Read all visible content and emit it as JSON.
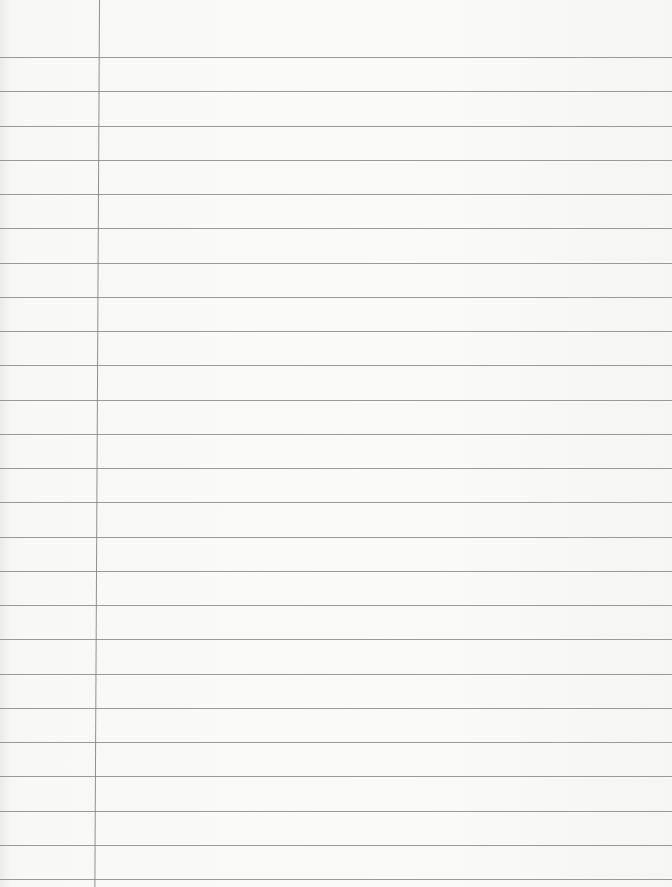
{
  "paper": {
    "type": "lined notebook paper",
    "ruled_line_count": 25,
    "has_margin_line": true,
    "line_color": "#7f8386",
    "background_color": "#f8f8f7"
  }
}
